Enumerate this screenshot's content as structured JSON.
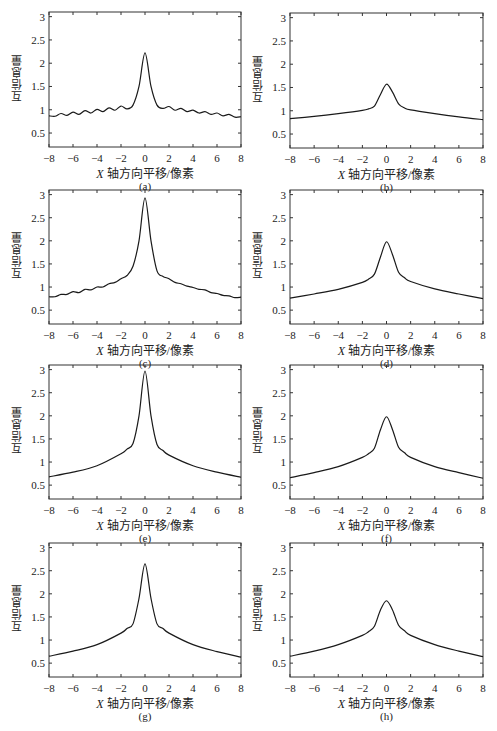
{
  "figure": {
    "xlabel": "X 轴方向平移/像素",
    "ylabel": "互信息量",
    "xticks": [
      -8,
      -6,
      -4,
      -2,
      0,
      2,
      4,
      6,
      8
    ],
    "yticks": [
      0.5,
      1,
      1.5,
      2,
      2.5,
      3
    ],
    "xlim": [
      -8,
      8
    ],
    "ylim": [
      0.2,
      3.1
    ]
  },
  "chart_data": [
    {
      "type": "line",
      "panel": "a",
      "caption": "(a)",
      "xlabel": "X 轴方向平移/像素",
      "ylabel": "互信息量",
      "xlim": [
        -8,
        8
      ],
      "ylim": [
        0.2,
        3.1
      ],
      "x": [
        -8,
        -7.5,
        -7,
        -6.5,
        -6,
        -5.5,
        -5,
        -4.5,
        -4,
        -3.5,
        -3,
        -2.5,
        -2,
        -1.5,
        -1,
        -0.5,
        0,
        0.5,
        1,
        1.5,
        2,
        2.5,
        3,
        3.5,
        4,
        4.5,
        5,
        5.5,
        6,
        6.5,
        7,
        7.5,
        8
      ],
      "y": [
        0.87,
        0.86,
        0.92,
        0.88,
        0.95,
        0.9,
        0.98,
        0.93,
        1.01,
        0.96,
        1.04,
        0.99,
        1.08,
        1.02,
        1.1,
        1.5,
        2.22,
        1.5,
        1.1,
        1.03,
        1.07,
        0.99,
        1.03,
        0.96,
        0.99,
        0.93,
        0.96,
        0.9,
        0.93,
        0.87,
        0.9,
        0.84,
        0.85
      ]
    },
    {
      "type": "line",
      "panel": "b",
      "caption": "(b)",
      "xlabel": "X 轴方向平移/像素",
      "ylabel": "互信息量",
      "xlim": [
        -8,
        8
      ],
      "ylim": [
        0.2,
        3.1
      ],
      "x": [
        -8,
        -6,
        -4,
        -2,
        -1.5,
        -1,
        -0.5,
        0,
        0.5,
        1,
        1.5,
        2,
        4,
        6,
        8
      ],
      "y": [
        0.83,
        0.88,
        0.94,
        1.01,
        1.04,
        1.1,
        1.35,
        1.57,
        1.4,
        1.15,
        1.06,
        1.02,
        0.94,
        0.87,
        0.81
      ]
    },
    {
      "type": "line",
      "panel": "c",
      "caption": "(c)",
      "xlabel": "X 轴方向平移/像素",
      "ylabel": "互信息量",
      "xlim": [
        -8,
        8
      ],
      "ylim": [
        0.2,
        3.1
      ],
      "x": [
        -8,
        -7.5,
        -7,
        -6.5,
        -6,
        -5.5,
        -5,
        -4.5,
        -4,
        -3.5,
        -3,
        -2.5,
        -2,
        -1.5,
        -1,
        -0.5,
        0,
        0.5,
        1,
        1.5,
        2,
        2.5,
        3,
        3.5,
        4,
        4.5,
        5,
        5.5,
        6,
        6.5,
        7,
        7.5,
        8
      ],
      "y": [
        0.79,
        0.79,
        0.84,
        0.84,
        0.9,
        0.88,
        0.95,
        0.94,
        1.0,
        1.0,
        1.07,
        1.1,
        1.18,
        1.25,
        1.45,
        2.0,
        2.93,
        2.0,
        1.35,
        1.23,
        1.18,
        1.1,
        1.07,
        1.02,
        0.99,
        0.95,
        0.94,
        0.88,
        0.86,
        0.82,
        0.81,
        0.77,
        0.78
      ]
    },
    {
      "type": "line",
      "panel": "d",
      "caption": "(d)",
      "xlabel": "X 轴方向平移/像素",
      "ylabel": "互信息量",
      "xlim": [
        -8,
        8
      ],
      "ylim": [
        0.2,
        3.1
      ],
      "x": [
        -8,
        -6,
        -4,
        -2,
        -1.5,
        -1,
        -0.5,
        0,
        0.5,
        1,
        1.5,
        2,
        4,
        6,
        8
      ],
      "y": [
        0.76,
        0.85,
        0.95,
        1.1,
        1.17,
        1.28,
        1.65,
        1.98,
        1.7,
        1.32,
        1.2,
        1.12,
        0.96,
        0.85,
        0.75
      ]
    },
    {
      "type": "line",
      "panel": "e",
      "caption": "(e)",
      "xlabel": "X 轴方向平移/像素",
      "ylabel": "互信息量",
      "xlim": [
        -8,
        8
      ],
      "ylim": [
        0.2,
        3.1
      ],
      "x": [
        -8,
        -6,
        -4,
        -2,
        -1.5,
        -1,
        -0.5,
        0,
        0.5,
        1,
        1.5,
        2,
        4,
        6,
        8
      ],
      "y": [
        0.68,
        0.78,
        0.92,
        1.18,
        1.28,
        1.4,
        2.0,
        2.97,
        2.0,
        1.38,
        1.25,
        1.15,
        0.92,
        0.78,
        0.67
      ]
    },
    {
      "type": "line",
      "panel": "f",
      "caption": "(f)",
      "xlabel": "X 轴方向平移/像素",
      "ylabel": "互信息量",
      "xlim": [
        -8,
        8
      ],
      "ylim": [
        0.2,
        3.1
      ],
      "x": [
        -8,
        -6,
        -4,
        -2,
        -1.5,
        -1,
        -0.5,
        0,
        0.5,
        1,
        1.5,
        2,
        4,
        6,
        8
      ],
      "y": [
        0.66,
        0.77,
        0.9,
        1.1,
        1.18,
        1.3,
        1.7,
        1.98,
        1.7,
        1.32,
        1.2,
        1.1,
        0.9,
        0.77,
        0.65
      ]
    },
    {
      "type": "line",
      "panel": "g",
      "caption": "(g)",
      "xlabel": "X 轴方向平移/像素",
      "ylabel": "互信息量",
      "xlim": [
        -8,
        8
      ],
      "ylim": [
        0.2,
        3.1
      ],
      "x": [
        -8,
        -6,
        -4,
        -2,
        -1.5,
        -1,
        -0.5,
        0,
        0.5,
        1,
        1.5,
        2,
        4,
        6,
        8
      ],
      "y": [
        0.65,
        0.76,
        0.9,
        1.15,
        1.25,
        1.35,
        1.9,
        2.65,
        1.9,
        1.35,
        1.25,
        1.15,
        0.9,
        0.75,
        0.63
      ]
    },
    {
      "type": "line",
      "panel": "h",
      "caption": "(h)",
      "xlabel": "X 轴方向平移/像素",
      "ylabel": "互信息量",
      "xlim": [
        -8,
        8
      ],
      "ylim": [
        0.2,
        3.1
      ],
      "x": [
        -8,
        -6,
        -4,
        -2,
        -1.5,
        -1,
        -0.5,
        0,
        0.5,
        1,
        1.5,
        2,
        4,
        6,
        8
      ],
      "y": [
        0.65,
        0.76,
        0.9,
        1.1,
        1.18,
        1.3,
        1.65,
        1.85,
        1.65,
        1.32,
        1.2,
        1.1,
        0.9,
        0.76,
        0.64
      ]
    }
  ]
}
